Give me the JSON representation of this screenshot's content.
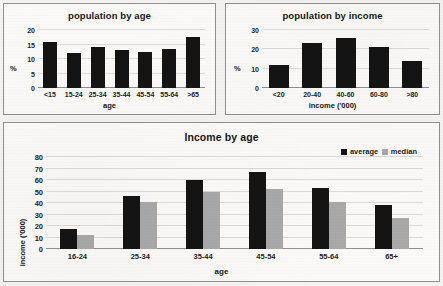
{
  "document": {
    "kind": "scanned-worksheet-charts",
    "colors": {
      "average": "#141414",
      "median": "#a9a9a9",
      "grid": "#dedbd6",
      "border": "#8e9096",
      "paper": "#fbfaf8"
    }
  },
  "charts": [
    {
      "id": "population-by-age",
      "title": "population by age",
      "ylabel": "%",
      "xlabel": "age"
    },
    {
      "id": "population-by-income",
      "title": "population by income",
      "ylabel": "%",
      "xlabel": "income ('000)"
    },
    {
      "id": "income-by-age",
      "title": "Income by age",
      "ylabel": "income ('000)",
      "xlabel": "age",
      "legend": [
        {
          "label": "average",
          "color": "#141414"
        },
        {
          "label": "median",
          "color": "#a9a9a9"
        }
      ]
    }
  ],
  "chart_data": [
    {
      "type": "bar",
      "id": "population-by-age",
      "title": "population by age",
      "xlabel": "age",
      "ylabel": "%",
      "categories": [
        "<15",
        "15-24",
        "25-34",
        "35-44",
        "45-54",
        "55-64",
        ">65"
      ],
      "values": [
        16,
        12,
        14,
        13,
        12.5,
        13.5,
        17.5
      ],
      "yticks": [
        0,
        5,
        10,
        15,
        20
      ],
      "ylim": [
        0,
        20
      ],
      "grid": true,
      "legend": "none"
    },
    {
      "type": "bar",
      "id": "population-by-income",
      "title": "population by income",
      "xlabel": "income ('000)",
      "ylabel": "%",
      "categories": [
        "<20",
        "20-40",
        "40-60",
        "60-80",
        ">80"
      ],
      "values": [
        12,
        23.5,
        26,
        21,
        14
      ],
      "yticks": [
        0,
        10,
        20,
        30
      ],
      "ylim": [
        0,
        30
      ],
      "grid": true,
      "legend": "none"
    },
    {
      "type": "bar",
      "id": "income-by-age",
      "title": "Income by age",
      "xlabel": "age",
      "ylabel": "income ('000)",
      "categories": [
        "16-24",
        "25-34",
        "35-44",
        "45-54",
        "55-64",
        "65+"
      ],
      "series": [
        {
          "name": "average",
          "color": "#141414",
          "values": [
            17,
            46,
            60,
            67,
            53,
            38.5
          ]
        },
        {
          "name": "median",
          "color": "#a9a9a9",
          "values": [
            12.5,
            40.5,
            49.5,
            52,
            40.5,
            27
          ]
        }
      ],
      "yticks": [
        0,
        10,
        20,
        30,
        40,
        50,
        60,
        70,
        80
      ],
      "ylim": [
        0,
        80
      ],
      "grid": true,
      "legend": "top-right"
    }
  ]
}
